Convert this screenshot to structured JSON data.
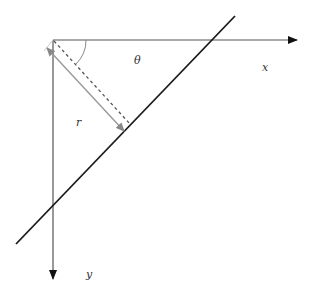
{
  "diagram": {
    "type": "line-normal-form",
    "labels": {
      "x_axis": "x",
      "y_axis": "y",
      "angle": "θ",
      "distance": "r"
    },
    "colors": {
      "axes": "#555555",
      "main_line": "#1a1a1a",
      "dashed_normal": "#555555",
      "distance_arrow": "#999999",
      "angle_arc": "#888888"
    }
  }
}
